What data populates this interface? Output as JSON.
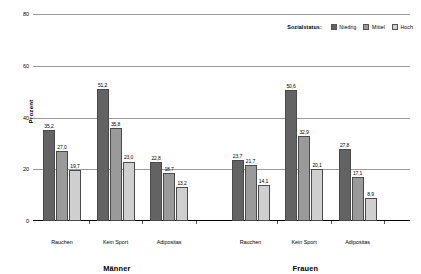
{
  "legend": {
    "title": "Sozialstatus:",
    "items": [
      {
        "label": "Niedrig",
        "color": "#636363"
      },
      {
        "label": "Mittel",
        "color": "#9a9a9a"
      },
      {
        "label": "Hoch",
        "color": "#cfcfcf"
      }
    ]
  },
  "axis": {
    "ylabel": "Prozent",
    "yticks": [
      "0",
      "20",
      "40",
      "60",
      "80"
    ]
  },
  "groups": [
    {
      "label": "Männer"
    },
    {
      "label": "Frauen"
    }
  ],
  "chart_data": {
    "type": "bar",
    "title": "",
    "xlabel": "",
    "ylabel": "Prozent",
    "ylim": [
      0,
      80
    ],
    "yticks": [
      0,
      20,
      40,
      60,
      80
    ],
    "grid": true,
    "legend_title": "Sozialstatus:",
    "legend_position": "top-right",
    "panels": [
      {
        "name": "Männer",
        "categories": [
          "Rauchen",
          "Kein Sport",
          "Adipositas"
        ],
        "series": [
          {
            "name": "Niedrig",
            "color": "#636363",
            "values": [
              35.2,
              51.2,
              22.8
            ],
            "labels": [
              "35,2",
              "51,2",
              "22,8"
            ]
          },
          {
            "name": "Mittel",
            "color": "#9a9a9a",
            "values": [
              27.0,
              35.8,
              18.7
            ],
            "labels": [
              "27,0",
              "35,8",
              "18,7"
            ]
          },
          {
            "name": "Hoch",
            "color": "#cfcfcf",
            "values": [
              19.7,
              23.0,
              13.2
            ],
            "labels": [
              "19,7",
              "23,0",
              "13,2"
            ]
          }
        ]
      },
      {
        "name": "Frauen",
        "categories": [
          "Rauchen",
          "Kein Sport",
          "Adipositas"
        ],
        "series": [
          {
            "name": "Niedrig",
            "color": "#636363",
            "values": [
              23.7,
              50.6,
              27.8
            ],
            "labels": [
              "23,7",
              "50,6",
              "27,8"
            ]
          },
          {
            "name": "Mittel",
            "color": "#9a9a9a",
            "values": [
              21.7,
              32.9,
              17.1
            ],
            "labels": [
              "21,7",
              "32,9",
              "17,1"
            ]
          },
          {
            "name": "Hoch",
            "color": "#cfcfcf",
            "values": [
              14.1,
              20.1,
              8.9
            ],
            "labels": [
              "14,1",
              "20,1",
              "8,9"
            ]
          }
        ]
      }
    ]
  }
}
